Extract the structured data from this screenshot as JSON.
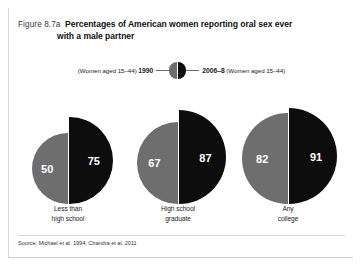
{
  "figure": {
    "number": "Figure 8.7a",
    "title_line1": "Percentages of American women reporting oral sex ever",
    "title_line2": "with a male partner",
    "source": "Source: Michael et al. 1994; Chandra et al. 2011"
  },
  "legend": {
    "left_text_prefix": "(Women aged 15–44) ",
    "left_series": "1990",
    "right_series": "2006–8",
    "right_text_suffix": " (Women aged 15–44)",
    "left_color": "#6e6e6e",
    "right_color": "#0d0d0d",
    "marker": "split-circle-icon"
  },
  "chart_data": {
    "type": "bar",
    "title": "Percentages of American women reporting oral sex ever with a male partner",
    "subtitle": "",
    "xlabel": "",
    "ylabel": "Percentage",
    "ylim": [
      0,
      100
    ],
    "grid": false,
    "legend_position": "top-center",
    "glyph": "paired-semicircles-area-proportional",
    "categories": [
      "Less than high school",
      "High school graduate",
      "Any college"
    ],
    "category_labels": [
      [
        "Less than",
        "high school"
      ],
      [
        "High school",
        "graduate"
      ],
      [
        "Any",
        "college"
      ]
    ],
    "series": [
      {
        "name": "1990",
        "group_label": "(Women aged 15–44) 1990",
        "color": "#6e6e6e",
        "values": [
          50,
          67,
          82
        ]
      },
      {
        "name": "2006–8",
        "group_label": "2006–8 (Women aged 15–44)",
        "color": "#0d0d0d",
        "values": [
          75,
          87,
          91
        ]
      }
    ],
    "annotations": [
      "50",
      "75",
      "67",
      "87",
      "82",
      "91"
    ],
    "source": "Source: Michael et al. 1994; Chandra et al. 2011"
  }
}
